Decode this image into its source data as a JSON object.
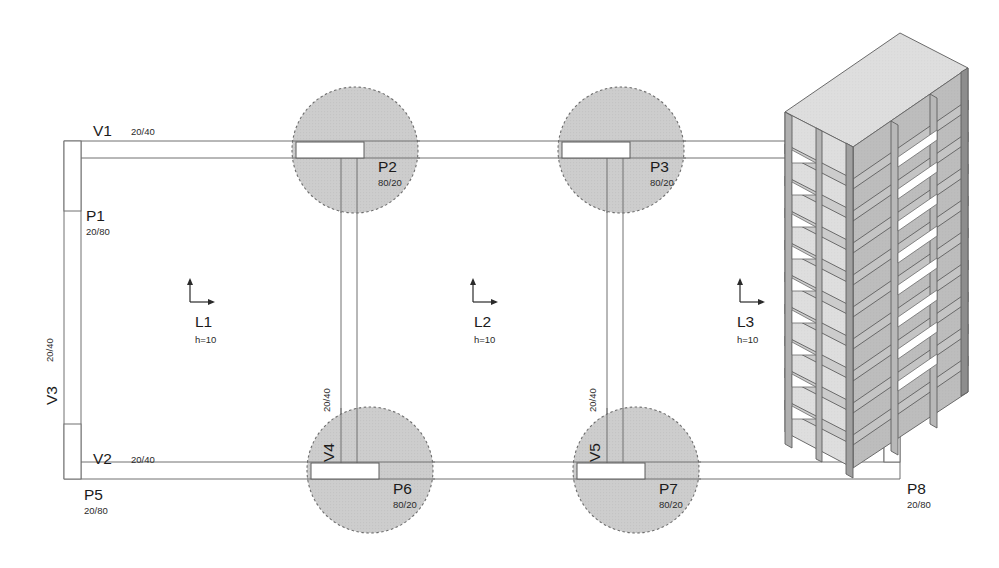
{
  "drawing": {
    "type": "structural-floor-plan",
    "background": "#ffffff",
    "line_color": "#6f6f6f",
    "column_circle_fill": "#c9c9c9",
    "column_circle_stroke": "#4a4a4a",
    "text_color": "#1b1b1b",
    "building_face_light": "#d9d9d9",
    "building_face_mid": "#b4b4b4",
    "building_face_dark": "#8a8a8a"
  },
  "beams": [
    {
      "id": "V1",
      "label": "V1",
      "section": "20/40",
      "orientation": "horizontal"
    },
    {
      "id": "V2",
      "label": "V2",
      "section": "20/40",
      "orientation": "horizontal"
    },
    {
      "id": "V3",
      "label": "V3",
      "section": "20/40",
      "orientation": "vertical"
    },
    {
      "id": "V4",
      "label": "V4",
      "section": "20/40",
      "orientation": "vertical"
    },
    {
      "id": "V5",
      "label": "V5",
      "section": "20/40",
      "orientation": "vertical"
    }
  ],
  "columns": [
    {
      "id": "P1",
      "label": "P1",
      "section": "20/80",
      "shape": "rectangle"
    },
    {
      "id": "P2",
      "label": "P2",
      "section": "80/20",
      "shape": "rectangle-in-circle"
    },
    {
      "id": "P3",
      "label": "P3",
      "section": "80/20",
      "shape": "rectangle-in-circle"
    },
    {
      "id": "P5",
      "label": "P5",
      "section": "20/80",
      "shape": "rectangle"
    },
    {
      "id": "P6",
      "label": "P6",
      "section": "80/20",
      "shape": "rectangle-in-circle"
    },
    {
      "id": "P7",
      "label": "P7",
      "section": "80/20",
      "shape": "rectangle-in-circle"
    },
    {
      "id": "P8",
      "label": "P8",
      "section": "20/80",
      "shape": "rectangle"
    }
  ],
  "slabs": [
    {
      "id": "L1",
      "label": "L1",
      "thickness": "h=10"
    },
    {
      "id": "L2",
      "label": "L2",
      "thickness": "h=10"
    },
    {
      "id": "L3",
      "label": "L3",
      "thickness": "h=10"
    }
  ],
  "labels": {
    "v1": "V1",
    "v1_dim": "20/40",
    "v2": "V2",
    "v2_dim": "20/40",
    "v3": "V3",
    "v3_dim": "20/40",
    "v4": "V4",
    "v4_dim": "20/40",
    "v5": "V5",
    "v5_dim": "20/40",
    "p1": "P1",
    "p1_dim": "20/80",
    "p2": "P2",
    "p2_dim": "80/20",
    "p3": "P3",
    "p3_dim": "80/20",
    "p5": "P5",
    "p5_dim": "20/80",
    "p6": "P6",
    "p6_dim": "80/20",
    "p7": "P7",
    "p7_dim": "80/20",
    "p8": "P8",
    "p8_dim": "20/80",
    "l1": "L1",
    "l1_h": "h=10",
    "l2": "L2",
    "l2_h": "h=10",
    "l3": "L3",
    "l3_h": "h=10"
  },
  "building_3d": {
    "name": "isometric-frame-building",
    "stories": 10,
    "bays_wide": 3,
    "bays_deep": 1
  }
}
